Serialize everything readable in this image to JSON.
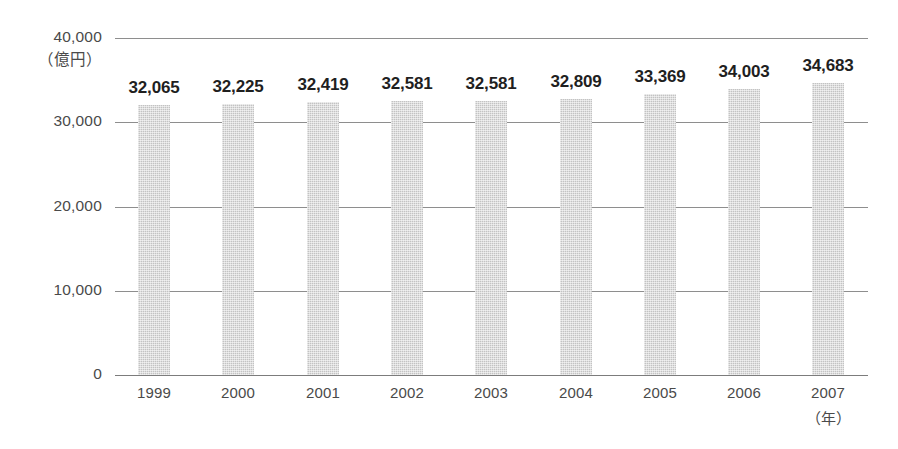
{
  "chart_data": {
    "type": "bar",
    "title": "",
    "subtitle": "",
    "xlabel": "（年）",
    "ylabel": "（億円）",
    "categories": [
      "1999",
      "2000",
      "2001",
      "2002",
      "2003",
      "2004",
      "2005",
      "2006",
      "2007"
    ],
    "values": [
      32065,
      32225,
      32419,
      32581,
      32581,
      32809,
      33369,
      34003,
      34683
    ],
    "value_labels": [
      "32,065",
      "32,225",
      "32,419",
      "32,581",
      "32,581",
      "32,809",
      "33,369",
      "34,003",
      "34,683"
    ],
    "ylim": [
      0,
      40000
    ],
    "ytick_values": [
      0,
      10000,
      20000,
      30000,
      40000
    ],
    "ytick_labels": [
      "0",
      "10,000",
      "20,000",
      "30,000",
      "40,000"
    ],
    "grid": true,
    "legend": false,
    "legend_position": "none",
    "bar_color": "#c3c3c3",
    "gridline_color": "#8e8e8e",
    "label_color": "#1f1f1f",
    "tick_color": "#4a4a4a",
    "background": "#ffffff"
  }
}
